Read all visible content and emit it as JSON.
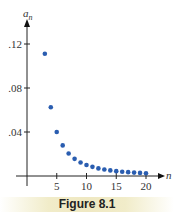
{
  "chart_data": {
    "type": "scatter",
    "title": "",
    "xlabel": "n",
    "ylabel": "a_n",
    "xlim": [
      0,
      21
    ],
    "ylim": [
      0,
      0.13
    ],
    "grid": false,
    "x_ticks": [
      5,
      10,
      15,
      20
    ],
    "x_tick_labels": [
      "5",
      "10",
      "15",
      "20"
    ],
    "y_ticks": [
      0.04,
      0.08,
      0.12
    ],
    "y_tick_labels": [
      ".04",
      ".08",
      ".12"
    ],
    "series": [
      {
        "name": "a_n",
        "color": "#2a5db0",
        "x": [
          3,
          4,
          5,
          6,
          7,
          8,
          9,
          10,
          11,
          12,
          13,
          14,
          15,
          16,
          17,
          18,
          19,
          20
        ],
        "y": [
          0.1111,
          0.0625,
          0.04,
          0.0278,
          0.0204,
          0.0156,
          0.0123,
          0.01,
          0.0083,
          0.0069,
          0.0059,
          0.0051,
          0.0044,
          0.0039,
          0.0035,
          0.0031,
          0.0028,
          0.0025
        ]
      }
    ]
  },
  "axes": {
    "y_label_main": "a",
    "y_label_sub": "n",
    "x_label": "n"
  },
  "caption": "Figure 8.1"
}
